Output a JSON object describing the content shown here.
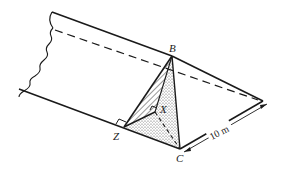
{
  "diagram": {
    "type": "3d-geometry",
    "points": {
      "B": {
        "label": "B"
      },
      "C": {
        "label": "C"
      },
      "X": {
        "label": "X"
      },
      "Z": {
        "label": "Z"
      }
    },
    "dimensions": [
      {
        "label": "10 m",
        "between": "C and right apex"
      }
    ],
    "markers": [
      "right-angle at Z",
      "right-angle at X"
    ],
    "colors": {
      "stroke": "#1a1a1a",
      "shade": "#d8d8d8",
      "background": "#ffffff"
    }
  }
}
